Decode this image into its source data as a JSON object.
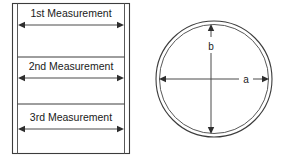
{
  "figure": {
    "title": "",
    "panels": [
      {
        "id": "rectangular-container-panel",
        "name": "rectangular-tank-measurements",
        "shape": "rectangle",
        "dimensions": [
          {
            "key": "m1",
            "label": "1st Measurement",
            "position": "top"
          },
          {
            "key": "m2",
            "label": "2nd Measurement",
            "position": "middle"
          },
          {
            "key": "m3",
            "label": "3rd Measurement",
            "position": "bottom"
          }
        ]
      },
      {
        "id": "circular-container-panel",
        "name": "circular-tank-dimensions",
        "shape": "circle",
        "dimensions": [
          {
            "key": "a",
            "label": "a",
            "orientation": "horizontal"
          },
          {
            "key": "b",
            "label": "b",
            "orientation": "vertical"
          }
        ]
      }
    ]
  },
  "colors": {
    "background": "#ffffff",
    "outline": "#3c3c3c",
    "arrow": "#4a4a4a",
    "text": "#1a1a1a"
  }
}
